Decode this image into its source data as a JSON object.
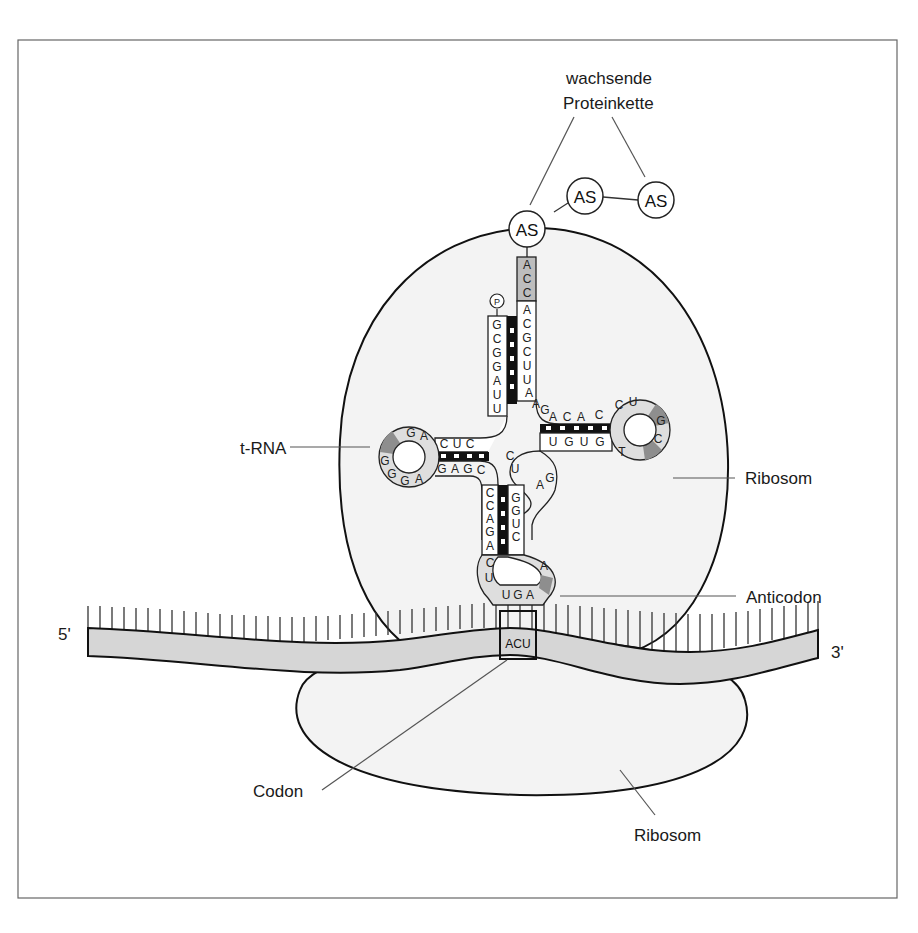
{
  "labels": {
    "protein_line1": "wachsende",
    "protein_line2": "Proteinkette",
    "trna": "t-RNA",
    "ribosome_large": "Ribosom",
    "anticodon": "Anticodon",
    "five_prime": "5'",
    "three_prime": "3'",
    "codon": "Codon",
    "ribosome_small": "Ribosom"
  },
  "amino_acids": [
    "AS",
    "AS",
    "AS"
  ],
  "phosphate": "P",
  "codon_sequence": "ACU",
  "anticodon_sequence": [
    "U",
    "G",
    "A"
  ],
  "acceptor_stem": {
    "cca_end": [
      "A",
      "C",
      "C"
    ],
    "three_prime_strand": [
      "A",
      "C",
      "G",
      "C",
      "U",
      "U",
      "A"
    ],
    "five_prime_strand": [
      "G",
      "C",
      "G",
      "G",
      "A",
      "U",
      "U"
    ]
  },
  "d_arm": {
    "stem_top": [
      "C",
      "U",
      "C"
    ],
    "stem_bottom": [
      "G",
      "A",
      "G",
      "C"
    ],
    "loop": [
      "G",
      "A",
      "G",
      "G",
      "G",
      "A"
    ]
  },
  "t_arm": {
    "stem_top": [
      "A",
      "C",
      "A",
      "C"
    ],
    "stem_bottom": [
      "U",
      "G",
      "U",
      "G"
    ],
    "loop": [
      "C",
      "U",
      "G",
      "C",
      "T"
    ]
  },
  "anticodon_arm": {
    "left_strand": [
      "C",
      "C",
      "A",
      "G",
      "A"
    ],
    "right_strand": [
      "G",
      "G",
      "U",
      "C"
    ],
    "loop_left": [
      "C",
      "U"
    ],
    "loop_right": [
      "A"
    ]
  },
  "variable_loop": [
    "A",
    "G",
    "C",
    "U",
    "A",
    "G"
  ],
  "colors": {
    "ribosome_fill": "#f3f3f3",
    "mrna_fill": "#d6d6d6",
    "shaded_base": "#bdbdbd",
    "dark_base": "#8e8e8e",
    "light_base": "#dedede",
    "outline": "#111111"
  }
}
